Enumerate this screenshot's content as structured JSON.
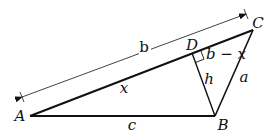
{
  "diagram": {
    "type": "triangle",
    "vertices": {
      "A": {
        "label": "A",
        "x": 30,
        "y": 116
      },
      "B": {
        "label": "B",
        "x": 215,
        "y": 116
      },
      "C": {
        "label": "C",
        "x": 253,
        "y": 30
      },
      "D": {
        "label": "D",
        "x": 192,
        "y": 53
      }
    },
    "side_labels": {
      "b": "b",
      "x": "x",
      "b_minus_x": "b − x",
      "h": "h",
      "a": "a",
      "c": "c"
    },
    "colors": {
      "stroke": "#111111",
      "background": "#ffffff"
    }
  }
}
